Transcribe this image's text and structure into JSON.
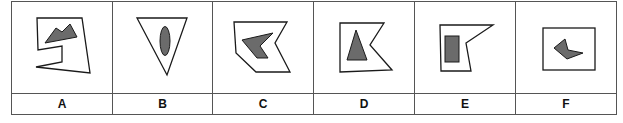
{
  "figure": {
    "colors": {
      "outline": "#1a1a1a",
      "fill_dark": "#6b6b6b",
      "grid": "#555555",
      "background": "#ffffff"
    },
    "options": [
      {
        "label": "A",
        "outer": "irregular polygon with notch",
        "inner": "double-peak mountain shape"
      },
      {
        "label": "B",
        "outer": "inverted triangle",
        "inner": "vertical ellipse"
      },
      {
        "label": "C",
        "outer": "chevron-notched hexagon",
        "inner": "left-pointing chevron"
      },
      {
        "label": "D",
        "outer": "pentagon with right notch",
        "inner": "triangle"
      },
      {
        "label": "E",
        "outer": "pentagon with right notch",
        "inner": "vertical rectangle"
      },
      {
        "label": "F",
        "outer": "rectangle",
        "inner": "small arrowhead shape"
      }
    ]
  }
}
